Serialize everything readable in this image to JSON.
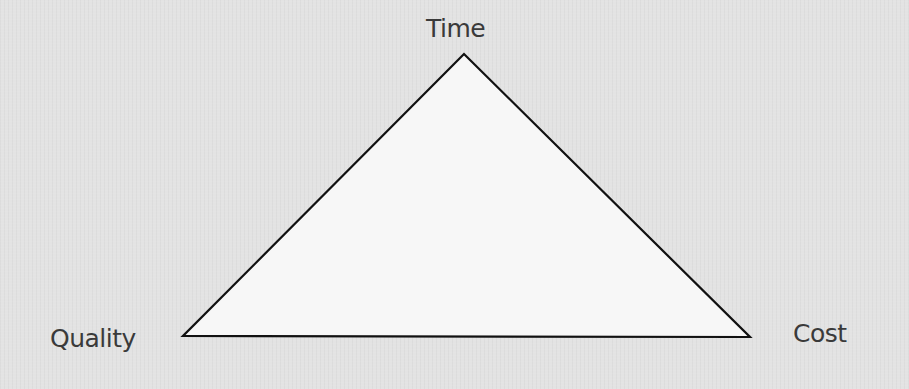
{
  "diagram": {
    "type": "triangle",
    "vertices": {
      "top": {
        "label": "Time"
      },
      "bottom_left": {
        "label": "Quality"
      },
      "bottom_right": {
        "label": "Cost"
      }
    },
    "colors": {
      "background": "#e3e3e3",
      "triangle_fill": "#f7f7f7",
      "triangle_stroke": "#111111",
      "label_text": "#3a3a3a"
    }
  }
}
